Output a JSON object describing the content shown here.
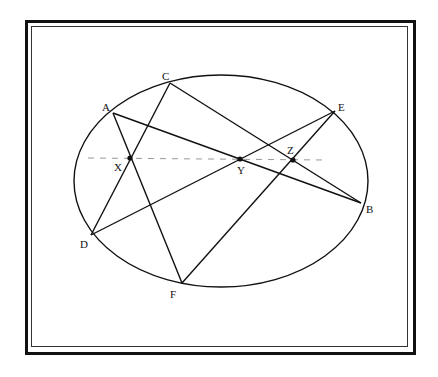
{
  "diagram": {
    "type": "pascal-theorem-conic",
    "ellipse": {
      "cx": 221,
      "cy": 181,
      "rx": 147,
      "ry": 106
    },
    "points": {
      "A": {
        "label": "A",
        "x": 113,
        "y": 113,
        "lx": 102,
        "ly": 111
      },
      "B": {
        "label": "B",
        "x": 361,
        "y": 203,
        "lx": 366,
        "ly": 213
      },
      "C": {
        "label": "C",
        "x": 170,
        "y": 83,
        "lx": 162,
        "ly": 80
      },
      "D": {
        "label": "D",
        "x": 91,
        "y": 235,
        "lx": 80,
        "ly": 248
      },
      "E": {
        "label": "E",
        "x": 335,
        "y": 111,
        "lx": 338,
        "ly": 111
      },
      "F": {
        "label": "F",
        "x": 182,
        "y": 283,
        "lx": 170,
        "ly": 298
      }
    },
    "intersections": {
      "X": {
        "label": "X",
        "x": 130,
        "y": 158,
        "lx": 114,
        "ly": 171
      },
      "Y": {
        "label": "Y",
        "x": 240,
        "y": 159,
        "lx": 237,
        "ly": 174
      },
      "Z": {
        "label": "Z",
        "x": 293,
        "y": 160,
        "lx": 287,
        "ly": 154
      }
    },
    "segments": [
      [
        "A",
        "B"
      ],
      [
        "A",
        "F"
      ],
      [
        "C",
        "B"
      ],
      [
        "C",
        "D"
      ],
      [
        "D",
        "E"
      ],
      [
        "E",
        "F"
      ]
    ],
    "pascal_line": {
      "x1": 88,
      "y1": 158,
      "x2": 326,
      "y2": 160,
      "style": "dashed"
    },
    "colors": {
      "stroke": "#111111",
      "dashed": "#999999",
      "background": "#ffffff"
    }
  }
}
